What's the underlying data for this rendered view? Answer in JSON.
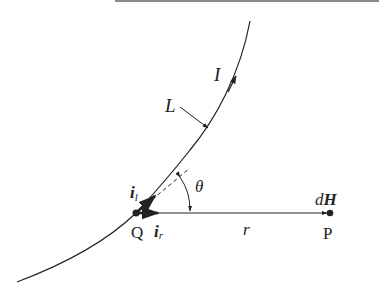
{
  "diagram": {
    "labels": {
      "current": "I",
      "curve": "L",
      "unit_tangent": "i",
      "unit_tangent_sub": "l",
      "angle": "θ",
      "source_point": "Q",
      "unit_radial": "i",
      "unit_radial_sub": "r",
      "distance": "r",
      "field_point": "P",
      "field_d": "d",
      "field_H": "H"
    },
    "colors": {
      "stroke": "#222222",
      "top_rule": "#8a8a8a"
    }
  }
}
